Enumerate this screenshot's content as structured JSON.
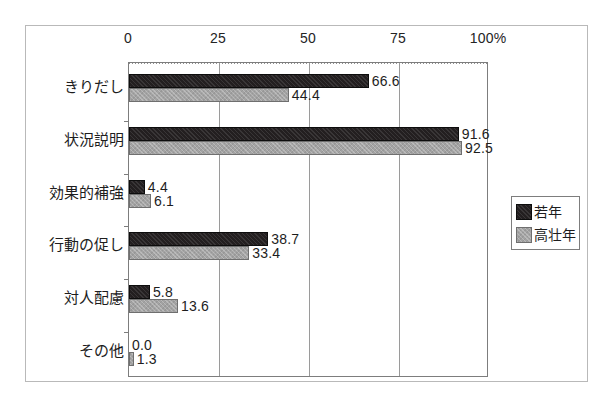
{
  "chart_data": {
    "type": "bar",
    "orientation": "horizontal",
    "title": "",
    "subtitle": "",
    "xlabel": "",
    "ylabel": "",
    "xlim": [
      0,
      100
    ],
    "ylim": null,
    "grid": true,
    "grid_axis": "x",
    "legend_position": "right",
    "categories": [
      "きりだし",
      "状況説明",
      "効果的補強",
      "行動の促し",
      "対人配慮",
      "その他"
    ],
    "xticks": [
      0,
      25,
      50,
      75,
      100
    ],
    "xticklabels": [
      "0",
      "25",
      "50",
      "75",
      "100%"
    ],
    "series": [
      {
        "name": "若年",
        "color": "#231f20",
        "values": [
          66.6,
          91.6,
          4.4,
          38.7,
          5.8,
          0.0
        ],
        "labels": [
          "66.6",
          "91.6",
          "4.4",
          "38.7",
          "5.8",
          "0.0"
        ]
      },
      {
        "name": "高壮年",
        "color": "#a3a3a3",
        "values": [
          44.4,
          92.5,
          6.1,
          33.4,
          13.6,
          1.3
        ],
        "labels": [
          "44.4",
          "92.5",
          "6.1",
          "33.4",
          "13.6",
          "1.3"
        ]
      }
    ]
  },
  "legend": {
    "entries": [
      {
        "label": "若年",
        "swatch": "series-young"
      },
      {
        "label": "高壮年",
        "swatch": "series-old"
      }
    ]
  },
  "colors": {
    "series_young": "#231f20",
    "series_old": "#a3a3a3",
    "frame": "#b9b9b9",
    "axis": "#7d7d7d",
    "grid": "#9a9a9a",
    "text": "#1d1d1d",
    "background": "#ffffff"
  }
}
